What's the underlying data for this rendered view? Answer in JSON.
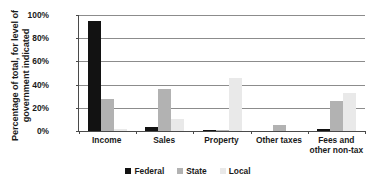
{
  "chart_data": {
    "type": "bar",
    "title": "",
    "xlabel": "",
    "ylabel": "Percentage of total, for level of government indicated",
    "ylim": [
      0,
      100
    ],
    "yticks": [
      "0%",
      "20%",
      "40%",
      "60%",
      "80%",
      "100%"
    ],
    "ytick_values": [
      0,
      20,
      40,
      60,
      80,
      100
    ],
    "grid": "horizontal",
    "legend_position": "bottom",
    "categories": [
      "Income",
      "Sales",
      "Property",
      "Other taxes",
      "Fees and other non-tax"
    ],
    "series": [
      {
        "name": "Federal",
        "color": "#121212",
        "values": [
          95,
          3.5,
          0.5,
          0,
          1.5
        ]
      },
      {
        "name": "State",
        "color": "#b2b2b2",
        "values": [
          28,
          36,
          1,
          5,
          26
        ]
      },
      {
        "name": "Local",
        "color": "#e9e9e9",
        "values": [
          1.5,
          10,
          46,
          0,
          33
        ]
      }
    ]
  }
}
